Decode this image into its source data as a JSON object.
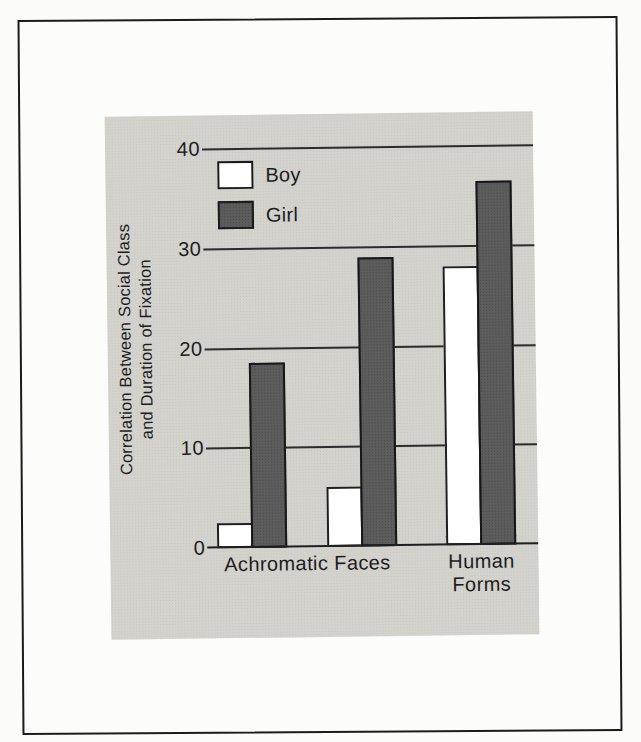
{
  "page": {
    "background_color": "#fbfbf8",
    "frame_color": "#1b1b1b",
    "panel_color": "#d3d2cd"
  },
  "chart_data": {
    "type": "bar",
    "title": "",
    "ylabel": "Correlation Between Social Class and Duration of Fixation",
    "ylabel_lines": [
      "Correlation Between Social Class",
      "and Duration of Fixation"
    ],
    "categories": [
      "4 mos.",
      "8 mos.",
      "13 mos."
    ],
    "category_group_labels": [
      {
        "label": "Achromatic Faces",
        "spans": [
          0,
          1
        ]
      },
      {
        "label": "Human Forms",
        "spans": [
          2,
          2
        ]
      }
    ],
    "series": [
      {
        "name": "Boy",
        "fill": "#ffffff",
        "values": [
          2.5,
          6,
          28
        ]
      },
      {
        "name": "Girl",
        "fill": "#5c5c5c",
        "values": [
          18.5,
          29,
          36.5
        ]
      }
    ],
    "yticks": [
      0,
      10,
      20,
      30,
      40
    ],
    "ylim": [
      0,
      40
    ],
    "grid": "horizontal",
    "legend_position": "top-left"
  }
}
